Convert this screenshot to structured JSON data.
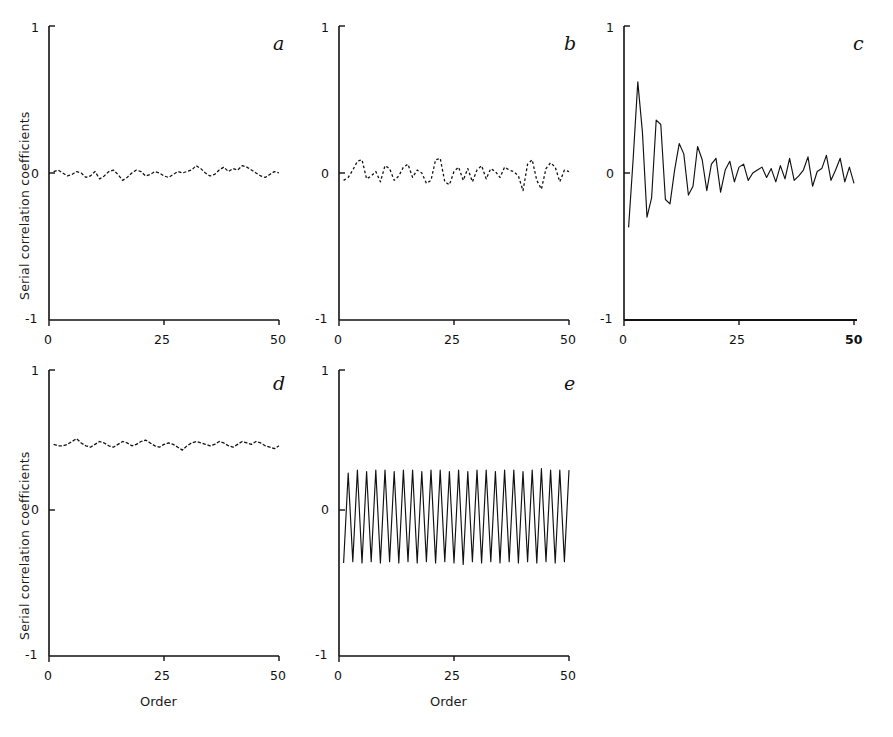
{
  "figure": {
    "axis_label_y": "Serial correlation coefficients",
    "axis_label_x": "Order",
    "ytick_top": "1",
    "ytick_mid": "0",
    "ytick_bot": "-1",
    "xtick_0": "0",
    "xtick_25": "25",
    "xtick_50": "50",
    "ink_color": "#111111"
  },
  "chart_data": [
    {
      "type": "line",
      "panel": "a",
      "title": "a",
      "xlabel": "Order",
      "ylabel": "Serial correlation coefficients",
      "xlim": [
        0,
        50
      ],
      "ylim": [
        -1,
        1
      ],
      "xticks": [
        0,
        25,
        50
      ],
      "yticks": [
        -1,
        0,
        1
      ],
      "grid": false,
      "legend": "none",
      "description": "White noise correlogram: coefficients scatter tightly about zero",
      "x": [
        1,
        2,
        3,
        4,
        5,
        6,
        7,
        8,
        9,
        10,
        11,
        12,
        13,
        14,
        15,
        16,
        17,
        18,
        19,
        20,
        21,
        22,
        23,
        24,
        25,
        26,
        27,
        28,
        29,
        30,
        31,
        32,
        33,
        34,
        35,
        36,
        37,
        38,
        39,
        40,
        41,
        42,
        43,
        44,
        45,
        46,
        47,
        48,
        49,
        50
      ],
      "values": [
        0.01,
        0.02,
        0.0,
        -0.02,
        -0.01,
        0.01,
        0.0,
        -0.03,
        -0.02,
        0.01,
        -0.04,
        -0.02,
        0.01,
        0.02,
        -0.01,
        -0.05,
        -0.03,
        0.0,
        0.02,
        0.01,
        -0.02,
        -0.01,
        0.01,
        0.0,
        -0.02,
        -0.03,
        -0.01,
        0.01,
        0.0,
        0.01,
        0.02,
        0.05,
        0.03,
        0.0,
        -0.02,
        -0.01,
        0.02,
        0.04,
        0.01,
        0.03,
        0.02,
        0.05,
        0.04,
        0.02,
        0.0,
        -0.02,
        -0.03,
        -0.01,
        0.01,
        0.0
      ]
    },
    {
      "type": "line",
      "panel": "b",
      "title": "b",
      "xlabel": "Order",
      "ylabel": "",
      "xlim": [
        0,
        50
      ],
      "ylim": [
        -1,
        1
      ],
      "xticks": [
        0,
        25,
        50
      ],
      "yticks": [
        -1,
        0,
        1
      ],
      "grid": false,
      "legend": "none",
      "description": "Noisy correlogram: larger random scatter about zero with bigger excursions toward higher orders",
      "x": [
        1,
        2,
        3,
        4,
        5,
        6,
        7,
        8,
        9,
        10,
        11,
        12,
        13,
        14,
        15,
        16,
        17,
        18,
        19,
        20,
        21,
        22,
        23,
        24,
        25,
        26,
        27,
        28,
        29,
        30,
        31,
        32,
        33,
        34,
        35,
        36,
        37,
        38,
        39,
        40,
        41,
        42,
        43,
        44,
        45,
        46,
        47,
        48,
        49,
        50
      ],
      "values": [
        -0.05,
        -0.03,
        0.02,
        0.08,
        0.09,
        -0.04,
        -0.02,
        0.01,
        -0.06,
        0.05,
        0.03,
        -0.05,
        -0.02,
        0.04,
        0.06,
        -0.03,
        0.02,
        0.0,
        -0.07,
        -0.05,
        0.09,
        0.1,
        -0.06,
        -0.08,
        0.01,
        0.04,
        -0.05,
        0.03,
        -0.06,
        0.02,
        0.05,
        -0.04,
        0.03,
        0.01,
        -0.03,
        0.04,
        0.02,
        0.01,
        -0.02,
        -0.12,
        0.06,
        0.09,
        -0.05,
        -0.11,
        0.03,
        0.07,
        0.04,
        -0.06,
        0.02,
        0.01
      ]
    },
    {
      "type": "line",
      "panel": "c",
      "title": "c",
      "xlabel": "Order",
      "ylabel": "",
      "xlim": [
        0,
        50
      ],
      "ylim": [
        -1,
        1
      ],
      "xticks": [
        0,
        25,
        50
      ],
      "yticks": [
        -1,
        0,
        1
      ],
      "grid": false,
      "legend": "none",
      "description": "Damped oscillatory correlogram: strong alternating swings that decay with increasing order",
      "x": [
        1,
        2,
        3,
        4,
        5,
        6,
        7,
        8,
        9,
        10,
        11,
        12,
        13,
        14,
        15,
        16,
        17,
        18,
        19,
        20,
        21,
        22,
        23,
        24,
        25,
        26,
        27,
        28,
        29,
        30,
        31,
        32,
        33,
        34,
        35,
        36,
        37,
        38,
        39,
        40,
        41,
        42,
        43,
        44,
        45,
        46,
        47,
        48,
        49,
        50
      ],
      "values": [
        -0.37,
        0.1,
        0.62,
        0.28,
        -0.3,
        -0.17,
        0.36,
        0.33,
        -0.18,
        -0.21,
        0.02,
        0.2,
        0.13,
        -0.15,
        -0.09,
        0.18,
        0.09,
        -0.12,
        0.06,
        0.1,
        -0.13,
        0.02,
        0.08,
        -0.06,
        0.04,
        0.06,
        -0.05,
        0.0,
        0.02,
        0.04,
        -0.03,
        0.03,
        -0.06,
        0.05,
        -0.04,
        0.1,
        -0.05,
        -0.02,
        0.02,
        0.11,
        -0.09,
        0.01,
        0.03,
        0.12,
        -0.05,
        0.02,
        0.1,
        -0.06,
        0.04,
        -0.07
      ]
    },
    {
      "type": "line",
      "panel": "d",
      "title": "d",
      "xlabel": "Order",
      "ylabel": "Serial correlation coefficients",
      "xlim": [
        0,
        50
      ],
      "ylim": [
        -1,
        1
      ],
      "xticks": [
        0,
        25,
        50
      ],
      "yticks": [
        -1,
        0,
        1
      ],
      "grid": false,
      "legend": "none",
      "description": "Persistent correlogram: coefficients remain nearly constant near +0.48 at all orders",
      "x": [
        1,
        2,
        3,
        4,
        5,
        6,
        7,
        8,
        9,
        10,
        11,
        12,
        13,
        14,
        15,
        16,
        17,
        18,
        19,
        20,
        21,
        22,
        23,
        24,
        25,
        26,
        27,
        28,
        29,
        30,
        31,
        32,
        33,
        34,
        35,
        36,
        37,
        38,
        39,
        40,
        41,
        42,
        43,
        44,
        45,
        46,
        47,
        48,
        49,
        50
      ],
      "values": [
        0.48,
        0.47,
        0.47,
        0.48,
        0.5,
        0.52,
        0.49,
        0.47,
        0.46,
        0.48,
        0.5,
        0.49,
        0.47,
        0.46,
        0.48,
        0.5,
        0.49,
        0.47,
        0.48,
        0.5,
        0.51,
        0.49,
        0.47,
        0.46,
        0.48,
        0.49,
        0.48,
        0.46,
        0.44,
        0.47,
        0.49,
        0.5,
        0.49,
        0.48,
        0.47,
        0.48,
        0.5,
        0.49,
        0.47,
        0.46,
        0.48,
        0.5,
        0.49,
        0.48,
        0.5,
        0.49,
        0.47,
        0.46,
        0.45,
        0.47
      ]
    },
    {
      "type": "line",
      "panel": "e",
      "title": "e",
      "xlabel": "Order",
      "ylabel": "",
      "xlim": [
        0,
        50
      ],
      "ylim": [
        -1,
        1
      ],
      "xticks": [
        0,
        25,
        50
      ],
      "yticks": [
        -1,
        0,
        1
      ],
      "grid": false,
      "legend": "none",
      "description": "Period-2 alternating correlogram: coefficients oscillate regularly between about +0.30 and -0.35",
      "x": [
        1,
        2,
        3,
        4,
        5,
        6,
        7,
        8,
        9,
        10,
        11,
        12,
        13,
        14,
        15,
        16,
        17,
        18,
        19,
        20,
        21,
        22,
        23,
        24,
        25,
        26,
        27,
        28,
        29,
        30,
        31,
        32,
        33,
        34,
        35,
        36,
        37,
        38,
        39,
        40,
        41,
        42,
        43,
        44,
        45,
        46,
        47,
        48,
        49,
        50
      ],
      "values": [
        -0.35,
        0.28,
        -0.34,
        0.3,
        -0.35,
        0.29,
        -0.34,
        0.3,
        -0.35,
        0.3,
        -0.34,
        0.29,
        -0.35,
        0.3,
        -0.34,
        0.3,
        -0.35,
        0.29,
        -0.34,
        0.3,
        -0.35,
        0.3,
        -0.34,
        0.29,
        -0.35,
        0.3,
        -0.36,
        0.29,
        -0.34,
        0.3,
        -0.35,
        0.3,
        -0.34,
        0.29,
        -0.35,
        0.3,
        -0.34,
        0.3,
        -0.35,
        0.29,
        -0.34,
        0.3,
        -0.35,
        0.31,
        -0.34,
        0.3,
        -0.35,
        0.3,
        -0.34,
        0.3
      ]
    }
  ]
}
